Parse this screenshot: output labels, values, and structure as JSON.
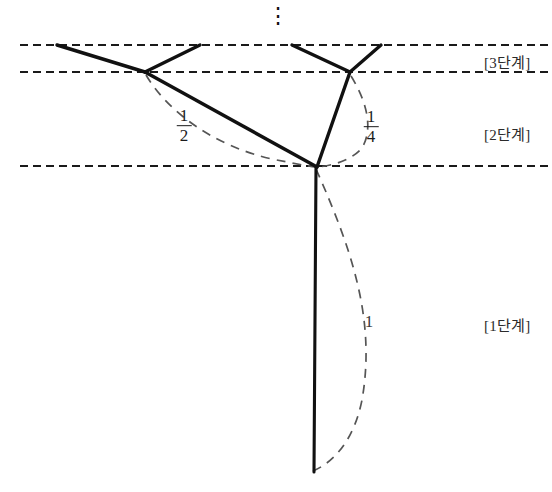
{
  "figure": {
    "background_color": "#ffffff",
    "width": 552,
    "height": 492,
    "ellipsis_glyph": "⋮"
  },
  "stage_labels": [
    {
      "id": "stage-3",
      "text": "[3단계]",
      "x": 484,
      "y": 59
    },
    {
      "id": "stage-2",
      "text": "[2단계]",
      "x": 484,
      "y": 131
    },
    {
      "id": "stage-1",
      "text": "[1단계]",
      "x": 484,
      "y": 322
    }
  ],
  "edge_labels": [
    {
      "id": "label-half",
      "numerator": "1",
      "denominator": "2",
      "x": 184,
      "y": 126
    },
    {
      "id": "label-quarter",
      "numerator": "1",
      "denominator": "4",
      "x": 371,
      "y": 127
    },
    {
      "id": "label-one",
      "text": "1",
      "x": 369,
      "y": 322
    }
  ],
  "guide_lines": [
    {
      "id": "guide-top",
      "y": 45,
      "x1": 20,
      "x2": 548
    },
    {
      "id": "guide-second",
      "y": 72,
      "x1": 20,
      "x2": 548
    },
    {
      "id": "guide-third",
      "y": 166,
      "x1": 20,
      "x2": 548
    }
  ],
  "nodes": [
    {
      "id": "junction-root",
      "x": 317,
      "y": 167
    },
    {
      "id": "node-left",
      "x": 145,
      "y": 72
    },
    {
      "id": "node-right",
      "x": 350,
      "y": 72
    },
    {
      "id": "leaf-1",
      "x": 57,
      "y": 45
    },
    {
      "id": "leaf-2",
      "x": 200,
      "y": 45
    },
    {
      "id": "leaf-3",
      "x": 292,
      "y": 45
    },
    {
      "id": "leaf-4",
      "x": 381,
      "y": 45
    },
    {
      "id": "trunk-bottom",
      "x": 314,
      "y": 472
    }
  ],
  "solid_edges": [
    {
      "id": "edge-trunk",
      "from": "junction-root",
      "to": "trunk-bottom"
    },
    {
      "id": "edge-root-left",
      "from": "junction-root",
      "to": "node-left"
    },
    {
      "id": "edge-root-right",
      "from": "junction-root",
      "to": "node-right"
    },
    {
      "id": "edge-left-leaf1",
      "from": "node-left",
      "to": "leaf-1"
    },
    {
      "id": "edge-left-leaf2",
      "from": "node-left",
      "to": "leaf-2"
    },
    {
      "id": "edge-right-leaf3",
      "from": "node-right",
      "to": "leaf-3"
    },
    {
      "id": "edge-right-leaf4",
      "from": "node-right",
      "to": "leaf-4"
    }
  ],
  "dashed_arcs": [
    {
      "id": "arc-trunk-length-1",
      "d": "M 316 169 C 352 250 376 320 362 400 C 354 440 334 462 313 471"
    },
    {
      "id": "arc-half-length",
      "d": "M 146 75 C 168 112 214 146 272 159 C 292 163 306 166 316 167"
    },
    {
      "id": "arc-quarter-length",
      "d": "M 351 76 C 366 100 374 128 362 148 C 352 160 332 166 317 167"
    }
  ],
  "colors": {
    "stroke": "#111111",
    "dashed_guide": "#1a1a1a",
    "dashed_arc": "#555555",
    "text": "#2b2b2b"
  }
}
